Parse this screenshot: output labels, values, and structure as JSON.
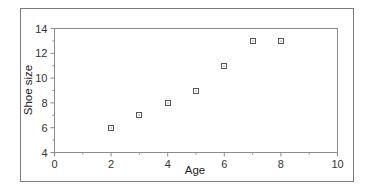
{
  "chart_data": {
    "type": "scatter",
    "title": "",
    "xlabel": "Age",
    "ylabel": "Shoe size",
    "xlim": [
      0,
      10
    ],
    "ylim": [
      4,
      14
    ],
    "xticks": [
      0,
      2,
      4,
      6,
      8,
      10
    ],
    "yticks": [
      4,
      6,
      8,
      10,
      12,
      14
    ],
    "x_minor_ticks": [
      1,
      3,
      5,
      7,
      9
    ],
    "y_minor_ticks": [
      5,
      7,
      9,
      11,
      13
    ],
    "grid": false,
    "legend": null,
    "marker": "square-with-dot",
    "series": [
      {
        "name": "Shoe size vs Age",
        "x": [
          2,
          3,
          4,
          5,
          6,
          7,
          8
        ],
        "y": [
          6,
          7,
          8,
          9,
          11,
          13,
          13
        ]
      }
    ]
  },
  "colors": {
    "frame": "#8c8c8c",
    "outer_border": "#7a7a7a",
    "marker": "#555555",
    "text": "#333333"
  }
}
